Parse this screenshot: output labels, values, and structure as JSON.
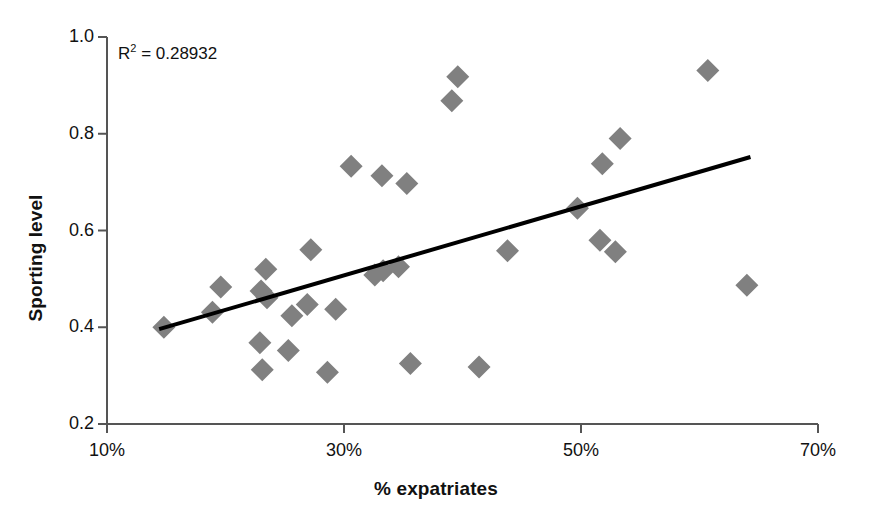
{
  "chart_data": {
    "type": "scatter",
    "title": "",
    "xlabel": "% expatriates",
    "ylabel": "Sporting level",
    "xlim": [
      10,
      70
    ],
    "ylim": [
      0.2,
      1.0
    ],
    "xticks": [
      "10%",
      "30%",
      "50%",
      "70%"
    ],
    "xtick_values": [
      10,
      30,
      50,
      70
    ],
    "yticks": [
      "0.2",
      "0.4",
      "0.6",
      "0.8",
      "1.0"
    ],
    "ytick_values": [
      0.2,
      0.4,
      0.6,
      0.8,
      1.0
    ],
    "grid": false,
    "legend": "none",
    "marker": "diamond",
    "marker_color": "#808080",
    "axis_color": "#555555",
    "trendline_color": "#000000",
    "annotations": [
      {
        "text_prefix": "R",
        "text_sup": "2",
        "text_suffix": " = 0.28932",
        "full": "R2 = 0.28932",
        "x": 13,
        "y": 0.975
      }
    ],
    "points": [
      {
        "x": 14.8,
        "y": 0.4
      },
      {
        "x": 18.9,
        "y": 0.431
      },
      {
        "x": 19.6,
        "y": 0.483
      },
      {
        "x": 23.4,
        "y": 0.52
      },
      {
        "x": 23.0,
        "y": 0.475
      },
      {
        "x": 23.5,
        "y": 0.461
      },
      {
        "x": 22.9,
        "y": 0.368
      },
      {
        "x": 23.1,
        "y": 0.312
      },
      {
        "x": 25.6,
        "y": 0.424
      },
      {
        "x": 25.3,
        "y": 0.352
      },
      {
        "x": 27.2,
        "y": 0.56
      },
      {
        "x": 26.9,
        "y": 0.447
      },
      {
        "x": 28.6,
        "y": 0.307
      },
      {
        "x": 29.3,
        "y": 0.437
      },
      {
        "x": 30.6,
        "y": 0.733
      },
      {
        "x": 33.2,
        "y": 0.713
      },
      {
        "x": 33.3,
        "y": 0.517
      },
      {
        "x": 32.6,
        "y": 0.508
      },
      {
        "x": 35.3,
        "y": 0.697
      },
      {
        "x": 34.6,
        "y": 0.525
      },
      {
        "x": 35.6,
        "y": 0.325
      },
      {
        "x": 39.6,
        "y": 0.918
      },
      {
        "x": 39.1,
        "y": 0.868
      },
      {
        "x": 41.4,
        "y": 0.318
      },
      {
        "x": 43.8,
        "y": 0.558
      },
      {
        "x": 49.7,
        "y": 0.646
      },
      {
        "x": 51.8,
        "y": 0.738
      },
      {
        "x": 53.3,
        "y": 0.79
      },
      {
        "x": 51.6,
        "y": 0.58
      },
      {
        "x": 52.9,
        "y": 0.556
      },
      {
        "x": 60.7,
        "y": 0.931
      },
      {
        "x": 64.0,
        "y": 0.487
      }
    ],
    "trendline": {
      "x0": 14.4,
      "y0": 0.396,
      "x1": 64.3,
      "y1": 0.752
    }
  }
}
